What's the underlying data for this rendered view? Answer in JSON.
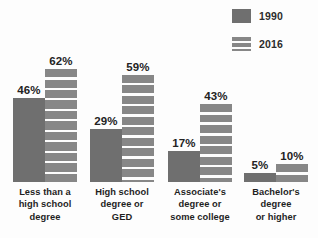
{
  "legend": {
    "position": "top-right",
    "entries": [
      {
        "label": "1990",
        "color": "#6f6f6f",
        "swatch_name": "legend-swatch-1990"
      },
      {
        "label": "2016",
        "color": "#878787",
        "swatch_name": "legend-swatch-2016"
      }
    ]
  },
  "colors": {
    "series_1990": "#6f6f6f",
    "series_2016": "#878787",
    "stripe": "#fdfdfd",
    "text": "#1f1f1f",
    "background": "#fdfdfd"
  },
  "chart_data": {
    "type": "bar",
    "title": "",
    "subtitle": "",
    "xlabel": "",
    "ylabel": "",
    "ylim": [
      0,
      65
    ],
    "grid": false,
    "legend_position": "top-right",
    "value_suffix": "%",
    "categories": [
      "Less than a high school degree",
      "High school degree or GED",
      "Associate's degree or some college",
      "Bachelor's degree or higher"
    ],
    "category_lines": [
      [
        "Less than a",
        "high school",
        "degree"
      ],
      [
        "High school",
        "degree or",
        "GED"
      ],
      [
        "Associate's",
        "degree or",
        "some college"
      ],
      [
        "Bachelor's",
        "degree",
        "or higher"
      ]
    ],
    "series": [
      {
        "name": "1990",
        "color": "#6f6f6f",
        "values": [
          46,
          29,
          17,
          5
        ],
        "labels": [
          "46%",
          "29%",
          "17%",
          "5%"
        ]
      },
      {
        "name": "2016",
        "color": "#878787",
        "values": [
          62,
          59,
          43,
          10
        ],
        "labels": [
          "62%",
          "59%",
          "43%",
          "10%"
        ]
      }
    ]
  },
  "geometry": {
    "baseline_y": 182,
    "px_per_percent": 1.82,
    "group_left": [
      13,
      90,
      168,
      244
    ],
    "group_width": 64,
    "bar_width": 32
  }
}
